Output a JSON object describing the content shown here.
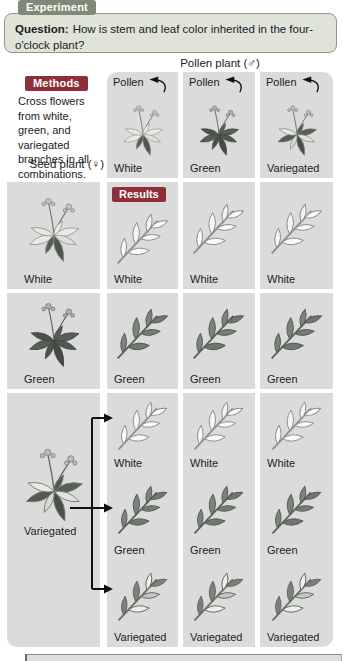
{
  "header": {
    "experiment_label": "Experiment",
    "question_label": "Question:",
    "question_text": "How is stem and leaf color inherited in the four-o'clock plant?"
  },
  "methods": {
    "label": "Methods",
    "text": "Cross flowers from white, green, and variegated branches in all combinations."
  },
  "results_label": "Results",
  "axes": {
    "pollen_header": "Pollen plant (♂)",
    "seed_header": "Seed plant (♀)",
    "pollen_arrow_label": "Pollen"
  },
  "pollen_columns": [
    {
      "label": "White",
      "type": "white"
    },
    {
      "label": "Green",
      "type": "green"
    },
    {
      "label": "Variegated",
      "type": "variegated"
    }
  ],
  "seed_rows": [
    {
      "label": "White",
      "type": "white"
    },
    {
      "label": "Green",
      "type": "green"
    },
    {
      "label": "Variegated",
      "type": "variegated"
    }
  ],
  "results_grid": {
    "white_seed_row": [
      "White",
      "White",
      "White"
    ],
    "green_seed_row": [
      "Green",
      "Green",
      "Green"
    ],
    "variegated_seed_rows": {
      "white": [
        "White",
        "White",
        "White"
      ],
      "green": [
        "Green",
        "Green",
        "Green"
      ],
      "variegated": [
        "Variegated",
        "Variegated",
        "Variegated"
      ]
    }
  },
  "colors": {
    "experiment_tab_bg": "#7e8a76",
    "question_box_bg": "#e0e4d8",
    "question_box_border": "#8f9784",
    "methods_results_tab_bg": "#8e2f3a",
    "cell_bg": "#dbdbdb",
    "arrow": "#111111",
    "text": "#1b1b1b"
  }
}
